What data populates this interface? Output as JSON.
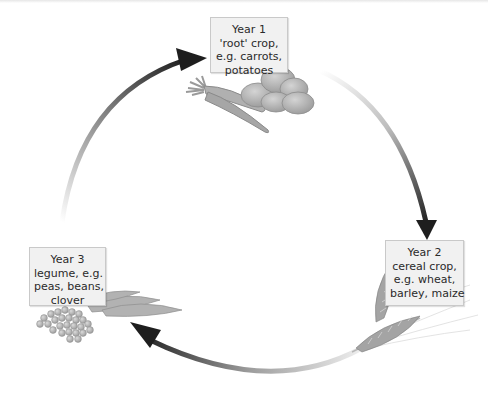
{
  "diagram": {
    "stages": [
      {
        "year_label": "Year 1",
        "lines": [
          "'root' crop,",
          "e.g. carrots,",
          "potatoes"
        ],
        "illustration": "carrots-and-potatoes"
      },
      {
        "year_label": "Year 2",
        "lines": [
          "cereal crop,",
          "e.g. wheat,",
          "barley, maize"
        ],
        "illustration": "wheat-ears"
      },
      {
        "year_label": "Year 3",
        "lines": [
          "legume, e.g.",
          "peas, beans,",
          "clover"
        ],
        "illustration": "pea-pods-and-peas"
      }
    ],
    "arrows": [
      {
        "from": "Year 1",
        "to": "Year 2",
        "direction": "clockwise"
      },
      {
        "from": "Year 2",
        "to": "Year 3",
        "direction": "clockwise"
      },
      {
        "from": "Year 3",
        "to": "Year 1",
        "direction": "clockwise"
      }
    ],
    "colors": {
      "arrow_dark": "#1e1e1e",
      "arrow_light": "#f4f4f4",
      "box_fill": "#f1f1f1",
      "box_border": "#c9c9c9",
      "illustration_gray": "#a8a8a8"
    }
  }
}
